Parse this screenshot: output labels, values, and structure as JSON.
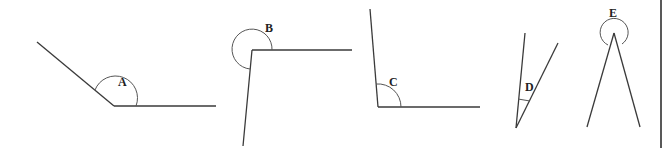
{
  "figure": {
    "angles": [
      {
        "label": "A",
        "type": "obtuse"
      },
      {
        "label": "B",
        "type": "reflex"
      },
      {
        "label": "C",
        "type": "right-ish"
      },
      {
        "label": "D",
        "type": "acute"
      },
      {
        "label": "E",
        "type": "reflex"
      }
    ]
  },
  "colors": {
    "line": "#3a3a3a",
    "background": "#ffffff"
  }
}
